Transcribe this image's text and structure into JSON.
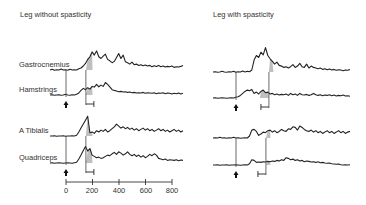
{
  "chart_data": {
    "type": "line",
    "panels": [
      {
        "title": "Leg without spasticity",
        "traces": [
          {
            "muscle": "Gastrocnemius",
            "onset_ms": 150,
            "peak_ms": 200,
            "values": [
              1,
              1.2,
              0.9,
              1.1,
              1,
              1.3,
              1,
              1.1,
              0.9,
              1.2,
              1,
              1.1,
              1,
              1.4,
              1.6,
              2.2,
              3,
              4.2,
              5,
              6.5,
              5.5,
              6.8,
              5,
              4.5,
              5.2,
              5.8,
              4.2,
              3.8,
              3.2,
              3.6,
              4.8,
              6,
              4.5,
              5.5,
              3.5,
              3.2,
              2.8,
              3.4,
              2.6,
              2.8,
              2.4,
              2.6,
              2.3,
              2.5,
              2.2,
              2.4,
              2,
              2.3,
              2.1,
              2.4,
              2,
              2.2,
              1.9,
              2.1,
              2,
              2.2,
              1.8,
              2,
              1.9,
              2.1,
              2.4
            ]
          },
          {
            "muscle": "Hamstrings",
            "onset_ms": 150,
            "peak_ms": 200,
            "values": [
              1,
              1.1,
              0.9,
              1,
              1.1,
              0.9,
              1,
              1.2,
              1,
              0.9,
              1.1,
              1,
              1.2,
              1.6,
              2.4,
              3,
              2.6,
              3.2,
              2.8,
              3.6,
              3.4,
              4.2,
              3.5,
              4,
              3.6,
              4.8,
              4.2,
              3.5,
              2.6,
              2.4,
              2.2,
              2,
              2.1,
              1.9,
              2,
              1.8,
              1.9,
              1.7,
              1.8,
              1.6,
              1.7,
              1.6,
              1.8,
              1.5,
              1.7,
              1.6,
              1.5,
              1.7,
              1.4,
              1.6,
              1.5,
              1.7,
              1.4,
              1.6,
              1.5,
              1.3,
              1.5,
              1.4,
              1.6,
              1.3,
              1.5
            ]
          },
          {
            "muscle": "A Tibialis",
            "onset_ms": 150,
            "peak_ms": 200,
            "values": [
              1,
              1,
              1.1,
              0.9,
              1,
              1,
              1.1,
              0.9,
              1,
              1,
              1.1,
              1,
              1.2,
              2.2,
              3.4,
              4.6,
              5.8,
              7,
              2,
              2.2,
              1.8,
              2.6,
              2.2,
              2.8,
              2.4,
              3,
              2.2,
              2.6,
              3.2,
              3.8,
              4.6,
              4,
              3.4,
              3.8,
              3.2,
              3.6,
              3,
              3.4,
              2.8,
              3.2,
              2.6,
              3,
              3.4,
              2.8,
              3.2,
              2.6,
              3,
              2.4,
              2.8,
              3.2,
              2.6,
              3,
              2.4,
              2.8,
              2.2,
              2.6,
              3,
              2.4,
              2.8,
              2.2,
              2.6
            ]
          },
          {
            "muscle": "Quadriceps",
            "onset_ms": 150,
            "peak_ms": 200,
            "values": [
              1,
              1.1,
              0.9,
              1,
              1.1,
              1,
              0.9,
              1,
              1.1,
              1,
              0.9,
              1.1,
              1.2,
              2.2,
              3.4,
              4.8,
              6,
              4.6,
              5.4,
              3.4,
              3,
              2.6,
              2.8,
              2.4,
              2.6,
              3,
              3.4,
              3.2,
              3.8,
              4.2,
              3.6,
              4.4,
              4,
              3.4,
              3.8,
              4.4,
              3.6,
              3.2,
              3.6,
              3,
              3.4,
              2.8,
              3.2,
              2.6,
              3,
              3.6,
              3.2,
              3.8,
              3.4,
              2.4,
              2.2,
              2,
              2.2,
              1.8,
              2,
              1.9,
              1.8,
              2,
              1.7,
              1.9,
              1.8
            ]
          }
        ]
      },
      {
        "title": "Leg with spasticity",
        "traces": [
          {
            "muscle": "Gastrocnemius",
            "onset_ms": 220,
            "peak_ms": 250,
            "values": [
              1,
              1.1,
              0.9,
              1,
              1.2,
              1,
              0.9,
              1.1,
              1,
              1.2,
              0.9,
              1.1,
              1,
              1.3,
              1,
              1.2,
              1.1,
              1.6,
              4.6,
              6,
              5.4,
              7,
              6.2,
              8.4,
              6,
              5,
              4.2,
              3.4,
              4,
              3,
              2.8,
              2.4,
              2.6,
              2.2,
              2.6,
              3.2,
              2.4,
              2.8,
              3.6,
              2.6,
              2.4,
              3.4,
              2.2,
              2.8,
              2.4,
              2.2,
              2,
              2.2,
              1.8,
              2,
              1.7,
              1.9,
              1.6,
              1.8,
              1.5,
              1.7,
              1.6,
              1.4,
              1.6,
              1.5,
              1.8
            ]
          },
          {
            "muscle": "Hamstrings",
            "onset_ms": 160,
            "peak_ms": 220,
            "values": [
              1,
              1.1,
              0.9,
              1,
              1.1,
              1,
              0.9,
              1,
              1.1,
              1,
              1.2,
              1.4,
              1.8,
              2.4,
              3,
              3.4,
              3.2,
              3.6,
              2.4,
              2.8,
              2.2,
              3,
              3.4,
              2.6,
              2.8,
              2.2,
              2.4,
              2,
              2.2,
              1.9,
              2.1,
              2,
              2.2,
              1.8,
              2.4,
              2,
              2.2,
              1.8,
              2.4,
              2,
              1.9,
              2.1,
              1.8,
              2,
              2.4,
              2,
              1.8,
              2,
              1.7,
              1.9,
              1.8,
              2,
              1.7,
              1.9,
              1.6,
              1.8,
              1.7,
              1.9,
              1.6,
              1.7,
              1.5
            ]
          },
          {
            "muscle": "A Tibialis",
            "onset_ms": 200,
            "peak_ms": 230,
            "values": [
              1,
              1.1,
              1,
              1.2,
              1,
              1.1,
              0.9,
              1.1,
              1,
              1.2,
              1,
              1.1,
              0.9,
              1,
              1.1,
              1,
              1.6,
              3.4,
              3.6,
              3,
              1.8,
              2.2,
              2.8,
              2.6,
              3.2,
              3.4,
              2.8,
              3.2,
              2.6,
              3,
              3.6,
              3.2,
              3,
              3.8,
              3.6,
              4.4,
              4.2,
              3.4,
              4.6,
              4.2,
              3.6,
              3.2,
              3,
              3.4,
              2.8,
              3.2,
              2.6,
              3,
              2.4,
              2.8,
              3.2,
              2.6,
              3,
              2.4,
              2.8,
              3.2,
              2.6,
              3,
              2.4,
              2.8,
              3
            ]
          },
          {
            "muscle": "Quadriceps",
            "onset_ms": 200,
            "peak_ms": 230,
            "values": [
              1,
              1,
              1.1,
              0.9,
              1,
              1,
              1.1,
              0.9,
              1,
              1,
              1.1,
              1,
              0.9,
              1,
              1.1,
              1,
              1.4,
              2.6,
              2.4,
              1.8,
              1.9,
              1.8,
              2,
              1.9,
              2.1,
              2,
              2.2,
              2.1,
              2.4,
              2.2,
              2.6,
              2.4,
              3.2,
              3,
              2.6,
              2.8,
              2.4,
              2.6,
              2.2,
              2.4,
              2,
              2.2,
              2.1,
              1.9,
              2,
              1.8,
              2,
              1.7,
              1.8,
              1.6,
              1.5,
              1.6,
              1.4,
              1.3,
              1.2,
              1.3,
              1.1,
              1,
              1.1,
              1,
              1.1
            ]
          }
        ]
      }
    ],
    "xaxis": {
      "ticks": [
        0,
        200,
        400,
        600,
        800
      ],
      "tick_labels": [
        "0",
        "200",
        "400",
        "600",
        "800"
      ],
      "range_ms": [
        0,
        800
      ],
      "xlabel": ""
    },
    "annotations": [
      "shaded onset-to-peak region",
      "upward arrow marks stimulus",
      "bracket marks onset latency"
    ]
  }
}
